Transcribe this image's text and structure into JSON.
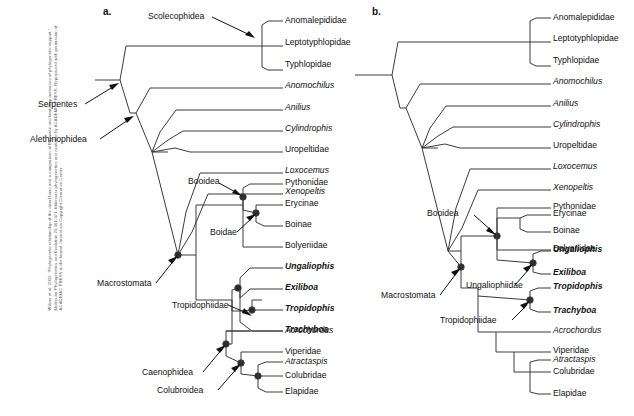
{
  "figure": {
    "credit": "Wilcox et al. 2002. \"Phylogenetic relationship of the dwarf boas and a comparison of Bayesian and bootstrap measures of phylogenetic support.\" Molecular Phylogenetics and Evolution 25:361-371. Molecular phylogenetics and evolution by ACADEMIC PRESS. Reproduced with permission of ACADEMIC PRESS in the format Journal via Copyright Clearance Center.",
    "panels": [
      {
        "letter": "a."
      },
      {
        "letter": "b."
      }
    ]
  },
  "panel_a": {
    "tips": [
      {
        "label": "Anomalepididae",
        "style": "roman"
      },
      {
        "label": "Leptotyphlopidae",
        "style": "roman"
      },
      {
        "label": "Typhlopidae",
        "style": "roman"
      },
      {
        "label": "Anomochilus",
        "style": "italic"
      },
      {
        "label": "Anilius",
        "style": "italic"
      },
      {
        "label": "Cylindrophis",
        "style": "italic"
      },
      {
        "label": "Uropeltidae",
        "style": "roman"
      },
      {
        "label": "Loxocemus",
        "style": "italic"
      },
      {
        "label": "Xenopeltis",
        "style": "italic"
      },
      {
        "label": "Pythonidae",
        "style": "roman"
      },
      {
        "label": "Erycinae",
        "style": "roman"
      },
      {
        "label": "Boinae",
        "style": "roman"
      },
      {
        "label": "Bolyeriidae",
        "style": "roman"
      },
      {
        "label": "Ungaliophis",
        "style": "bold-italic"
      },
      {
        "label": "Exiliboa",
        "style": "bold-italic"
      },
      {
        "label": "Tropidophis",
        "style": "bold-italic"
      },
      {
        "label": "Trachyboa",
        "style": "bold-italic"
      },
      {
        "label": "Acrochordus",
        "style": "italic"
      },
      {
        "label": "Viperidae",
        "style": "roman"
      },
      {
        "label": "Atractaspis",
        "style": "italic"
      },
      {
        "label": "Colubridae",
        "style": "roman"
      },
      {
        "label": "Elapidae",
        "style": "roman"
      }
    ],
    "clades": [
      {
        "label": "Scolecophidea"
      },
      {
        "label": "Serpentes"
      },
      {
        "label": "Alethinophidea"
      },
      {
        "label": "Booidea"
      },
      {
        "label": "Boidae"
      },
      {
        "label": "Macrostomata"
      },
      {
        "label": "Tropidophiidae"
      },
      {
        "label": "Caenophidea"
      },
      {
        "label": "Colubroidea"
      }
    ]
  },
  "panel_b": {
    "tips": [
      {
        "label": "Anomalepididae",
        "style": "roman"
      },
      {
        "label": "Leptotyphlopidae",
        "style": "roman"
      },
      {
        "label": "Typhlopidae",
        "style": "roman"
      },
      {
        "label": "Anomochilus",
        "style": "italic"
      },
      {
        "label": "Anilius",
        "style": "italic"
      },
      {
        "label": "Cylindrophis",
        "style": "italic"
      },
      {
        "label": "Uropeltidae",
        "style": "roman"
      },
      {
        "label": "Loxocemus",
        "style": "italic"
      },
      {
        "label": "Xenopeltis",
        "style": "italic"
      },
      {
        "label": "Pythonidae",
        "style": "roman"
      },
      {
        "label": "Erycinae",
        "style": "roman"
      },
      {
        "label": "Boinae",
        "style": "roman"
      },
      {
        "label": "Bolyeriidae",
        "style": "roman"
      },
      {
        "label": "Ungaliophis",
        "style": "bold-italic"
      },
      {
        "label": "Exiliboa",
        "style": "bold-italic"
      },
      {
        "label": "Tropidophis",
        "style": "bold-italic"
      },
      {
        "label": "Trachyboa",
        "style": "bold-italic"
      },
      {
        "label": "Acrochordus",
        "style": "italic"
      },
      {
        "label": "Viperidae",
        "style": "roman"
      },
      {
        "label": "Atractaspis",
        "style": "italic"
      },
      {
        "label": "Colubridae",
        "style": "roman"
      },
      {
        "label": "Elapidae",
        "style": "roman"
      }
    ],
    "clades": [
      {
        "label": "Booidea"
      },
      {
        "label": "Macrostomata"
      },
      {
        "label": "Ungaliophiidae"
      },
      {
        "label": "Tropidophiidae"
      }
    ]
  },
  "colors": {
    "line": "#3a3a3a",
    "node": "#2b2b2b",
    "text": "#111111",
    "background": "#ffffff"
  }
}
